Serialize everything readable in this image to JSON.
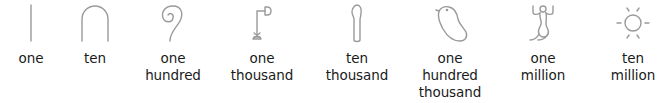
{
  "numerals": [
    {
      "icon": "stroke-icon",
      "value": 1,
      "label_lines": [
        "one"
      ]
    },
    {
      "icon": "heel-bone-icon",
      "value": 10,
      "label_lines": [
        "ten"
      ]
    },
    {
      "icon": "coil-of-rope-icon",
      "value": 100,
      "label_lines": [
        "one",
        "hundred"
      ]
    },
    {
      "icon": "lotus-plant-icon",
      "value": 1000,
      "label_lines": [
        "one",
        "thousand"
      ]
    },
    {
      "icon": "finger-icon",
      "value": 10000,
      "label_lines": [
        "ten",
        "thousand"
      ]
    },
    {
      "icon": "tadpole-icon",
      "value": 100000,
      "label_lines": [
        "one",
        "hundred",
        "thousand"
      ]
    },
    {
      "icon": "heh-god-icon",
      "value": 1000000,
      "label_lines": [
        "one",
        "million"
      ]
    },
    {
      "icon": "sun-icon",
      "value": 10000000,
      "label_lines": [
        "ten",
        "million"
      ]
    }
  ],
  "colors": {
    "glyph_stroke": "#9a9a9a",
    "label_text": "#1a1a1a",
    "background": "#ffffff"
  }
}
